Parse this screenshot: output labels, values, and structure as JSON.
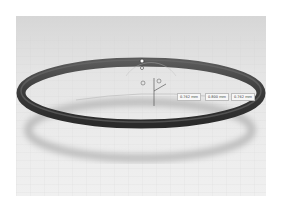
{
  "viewport": {
    "label": "3D ring model viewport",
    "background_top": "#d6d6d6",
    "background_bottom": "#f0f0f0"
  },
  "model": {
    "name": "ring",
    "color": "#3f3f3f",
    "shadow_color": "#bdbdbd"
  },
  "dimensions": [
    {
      "label": "0.762 mm"
    },
    {
      "label": "0.800 mm"
    },
    {
      "label": "0.762 mm"
    }
  ],
  "gizmo": {
    "axis_label": "x"
  }
}
